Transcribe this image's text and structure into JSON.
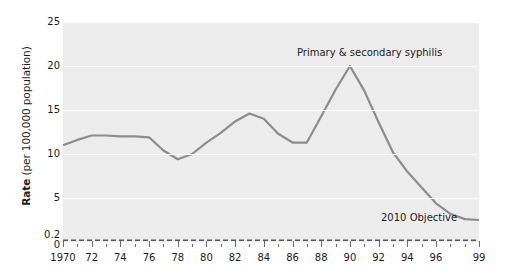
{
  "chart_data": {
    "type": "line",
    "title": "",
    "xlabel": "",
    "ylabel": "Rate (per 100,000 population)",
    "ylabel_bold_part": "Rate",
    "ylabel_rest": " (per 100,000 population)",
    "xlim": [
      1970,
      1999
    ],
    "ylim": [
      0,
      25
    ],
    "grid": true,
    "yticks": [
      {
        "value": 25,
        "label": "25"
      },
      {
        "value": 20,
        "label": "20"
      },
      {
        "value": 15,
        "label": "15"
      },
      {
        "value": 10,
        "label": "10"
      },
      {
        "value": 5,
        "label": "5"
      },
      {
        "value": 0.2,
        "label": "0.2"
      },
      {
        "value": 0,
        "label": "0"
      }
    ],
    "xticks": [
      1970,
      1971,
      1972,
      1973,
      1974,
      1975,
      1976,
      1977,
      1978,
      1979,
      1980,
      1981,
      1982,
      1983,
      1984,
      1985,
      1986,
      1987,
      1988,
      1989,
      1990,
      1991,
      1992,
      1993,
      1994,
      1995,
      1996,
      1997,
      1998,
      1999
    ],
    "xtick_labels": [
      {
        "value": 1970,
        "label": "1970"
      },
      {
        "value": 1972,
        "label": "72"
      },
      {
        "value": 1974,
        "label": "74"
      },
      {
        "value": 1976,
        "label": "76"
      },
      {
        "value": 1978,
        "label": "78"
      },
      {
        "value": 1980,
        "label": "80"
      },
      {
        "value": 1982,
        "label": "82"
      },
      {
        "value": 1984,
        "label": "84"
      },
      {
        "value": 1986,
        "label": "86"
      },
      {
        "value": 1988,
        "label": "88"
      },
      {
        "value": 1990,
        "label": "90"
      },
      {
        "value": 1992,
        "label": "92"
      },
      {
        "value": 1994,
        "label": "94"
      },
      {
        "value": 1996,
        "label": "96"
      },
      {
        "value": 1999,
        "label": "99"
      }
    ],
    "series": [
      {
        "name": "Primary & secondary syphilis",
        "color": "#8c8c8c",
        "style": "solid",
        "x": [
          1970,
          1971,
          1972,
          1973,
          1974,
          1975,
          1976,
          1977,
          1978,
          1979,
          1980,
          1981,
          1982,
          1983,
          1984,
          1985,
          1986,
          1987,
          1988,
          1989,
          1990,
          1991,
          1992,
          1993,
          1994,
          1995,
          1996,
          1997,
          1998,
          1999
        ],
        "values": [
          11.0,
          11.6,
          12.1,
          12.1,
          12.0,
          12.0,
          11.9,
          10.4,
          9.4,
          10.0,
          11.3,
          12.4,
          13.7,
          14.6,
          14.0,
          12.3,
          11.3,
          11.3,
          14.3,
          17.3,
          20.0,
          17.2,
          13.6,
          10.2,
          8.0,
          6.2,
          4.4,
          3.2,
          2.6,
          2.5
        ]
      },
      {
        "name": "2010 Objective",
        "color": "#555555",
        "style": "dashed",
        "x": [
          1970,
          1999
        ],
        "values": [
          0.2,
          0.2
        ]
      }
    ],
    "annotations": [
      {
        "name": "series-label",
        "text": "Primary & secondary syphilis"
      },
      {
        "name": "objective-label",
        "text": "2010 Objective"
      }
    ]
  }
}
